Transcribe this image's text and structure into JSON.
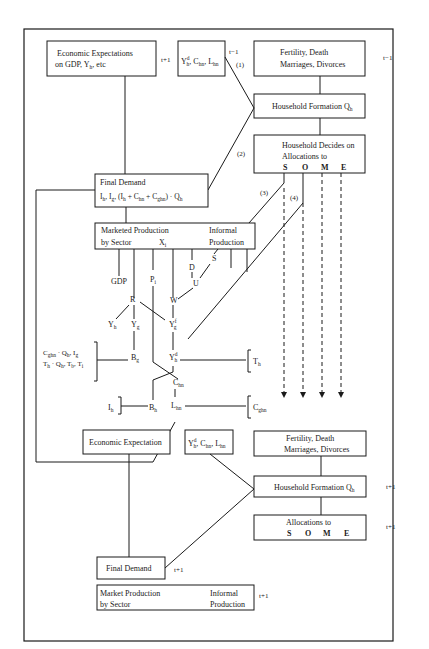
{
  "diagram": {
    "top": {
      "econ_expect": {
        "line1": "Economic Expectations",
        "line2a": "on GDP, Y",
        "line2sub": "h",
        "line2b": ", etc",
        "period": "t+1"
      },
      "hh_vars": {
        "y": "Y",
        "ysup": "d",
        "ysub": "h",
        "c": ", C",
        "csub": "hn",
        "l": ", L",
        "lsub": "hn",
        "period": "t−1"
      },
      "fertility": {
        "line1": "Fertility, Death",
        "line2": "Marriages, Divorces",
        "period": "t−1"
      },
      "hh_formation": {
        "label": "Household Formation Q",
        "sub": "h"
      },
      "hh_decides": {
        "line1": "Household Decides on",
        "line2": "Allocations to",
        "letters": [
          "S",
          "O",
          "M",
          "E"
        ]
      },
      "final_demand": {
        "line1": "Final Demand",
        "line2": "I",
        "formula": "I_h, I_g, (I_h + C_hn + C_ghn) · Q_h"
      },
      "marketed_production": {
        "line1": "Marketed Production",
        "line2": "by Sector",
        "xi": "X",
        "xi_sub": "i",
        "informal1": "Informal",
        "informal2": "Production"
      },
      "links": [
        "(1)",
        "(2)",
        "(3)",
        "(4)"
      ]
    },
    "middle": {
      "nodes": {
        "gdp": "GDP",
        "pi": "P",
        "pi_sub": "i",
        "r": "R",
        "w": "W",
        "d": "D",
        "u": "U",
        "s": "S",
        "yh": "Y",
        "yh_sub": "h",
        "yg": "Y",
        "yg_sub": "g",
        "yfg": "Y",
        "yfg_sup": "f",
        "yfg_sub": "g",
        "bg": "B",
        "bg_sub": "g",
        "ydh": "Y",
        "ydh_sup": "d",
        "ydh_sub": "h",
        "chn": "C",
        "chn_sub": "hn",
        "bh": "B",
        "bh_sub": "h",
        "lhn": "L",
        "lhn_sub": "hn",
        "ih": "I",
        "ih_sub": "h",
        "th": "T",
        "th_sub": "h",
        "cghn": "C",
        "cghn_sub": "ghn"
      },
      "bracket_left": {
        "line1": "C_ghn · Q_h, I_g",
        "line2": "T_h · Q_h, T_b, T_i"
      }
    },
    "bottom": {
      "econ_expect": {
        "label": "Economic Expectation"
      },
      "hh_vars": {
        "y": "Y",
        "ysup": "d",
        "ysub": "h",
        "c": ", C",
        "csub": "hn",
        "l": ", L",
        "lsub": "hn"
      },
      "fertility": {
        "line1": "Fertility, Death",
        "line2": "Marriages, Divorces"
      },
      "hh_formation": {
        "label": "Household Formation Q",
        "sub": "h",
        "period": "t+1"
      },
      "allocations": {
        "line1": "Allocations to",
        "letters": [
          "S",
          "O",
          "M",
          "E"
        ],
        "period": "t+1"
      },
      "final_demand": {
        "label": "Final Demand",
        "period": "t+1"
      },
      "market_production": {
        "line1": "Market Production",
        "line2": "by Sector",
        "informal1": "Informal",
        "informal2": "Production",
        "period": "t+1"
      }
    }
  }
}
